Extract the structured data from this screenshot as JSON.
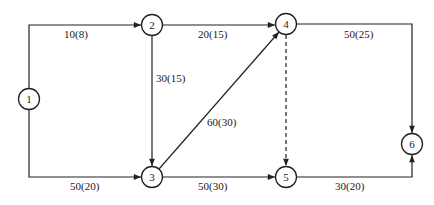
{
  "diagram": {
    "type": "network-flow",
    "nodes": [
      {
        "id": "1",
        "label": "1"
      },
      {
        "id": "2",
        "label": "2"
      },
      {
        "id": "3",
        "label": "3"
      },
      {
        "id": "4",
        "label": "4"
      },
      {
        "id": "5",
        "label": "5"
      },
      {
        "id": "6",
        "label": "6"
      }
    ],
    "edges": [
      {
        "from": "1",
        "to": "2",
        "label": "10(8)",
        "style": "solid"
      },
      {
        "from": "2",
        "to": "4",
        "label": "20(15)",
        "style": "solid"
      },
      {
        "from": "2",
        "to": "3",
        "label": "30(15)",
        "style": "solid"
      },
      {
        "from": "4",
        "to": "6",
        "label": "50(25)",
        "style": "solid"
      },
      {
        "from": "3",
        "to": "4",
        "label": "60(30)",
        "style": "solid"
      },
      {
        "from": "4",
        "to": "5",
        "label": "",
        "style": "dashed"
      },
      {
        "from": "1",
        "to": "3",
        "label": "50(20)",
        "style": "solid"
      },
      {
        "from": "3",
        "to": "5",
        "label": "50(30)",
        "style": "solid"
      },
      {
        "from": "5",
        "to": "6",
        "label": "30(20)",
        "style": "solid"
      }
    ]
  }
}
